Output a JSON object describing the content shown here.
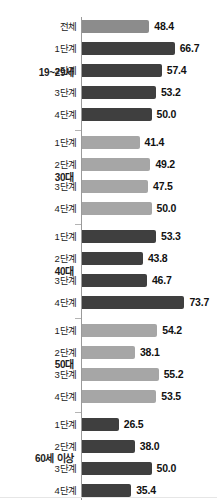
{
  "chart_data": {
    "type": "bar",
    "orientation": "horizontal",
    "title": "",
    "subtitle": "",
    "xlabel": "",
    "ylabel": "",
    "xlim": [
      0,
      80
    ],
    "grid": false,
    "legend": "none",
    "value_format": "one-decimal",
    "axis_color": "#9a9a9a",
    "colors": {
      "total_bar": "#8c8c8c",
      "dark_bar": "#3f3f3f",
      "light_bar": "#a6a6a6",
      "text": "#1c1c1c",
      "background": "#ffffff"
    },
    "groups": [
      {
        "label": "19~29세",
        "shade": "dark",
        "rows": [
          {
            "category": "전체",
            "value": 48.4,
            "shade": "total"
          },
          {
            "category": "1단계",
            "value": 66.7,
            "shade": "dark"
          },
          {
            "category": "2단계",
            "value": 57.4,
            "shade": "dark"
          },
          {
            "category": "3단계",
            "value": 53.2,
            "shade": "dark"
          },
          {
            "category": "4단계",
            "value": 50.0,
            "shade": "dark"
          }
        ]
      },
      {
        "label": "30대",
        "shade": "light",
        "rows": [
          {
            "category": "1단계",
            "value": 41.4,
            "shade": "light"
          },
          {
            "category": "2단계",
            "value": 49.2,
            "shade": "light"
          },
          {
            "category": "3단계",
            "value": 47.5,
            "shade": "light"
          },
          {
            "category": "4단계",
            "value": 50.0,
            "shade": "light"
          }
        ]
      },
      {
        "label": "40대",
        "shade": "dark",
        "rows": [
          {
            "category": "1단계",
            "value": 53.3,
            "shade": "dark"
          },
          {
            "category": "2단계",
            "value": 43.8,
            "shade": "dark"
          },
          {
            "category": "3단계",
            "value": 46.7,
            "shade": "dark"
          },
          {
            "category": "4단계",
            "value": 73.7,
            "shade": "dark"
          }
        ]
      },
      {
        "label": "50대",
        "shade": "light",
        "rows": [
          {
            "category": "1단계",
            "value": 54.2,
            "shade": "light"
          },
          {
            "category": "2단계",
            "value": 38.1,
            "shade": "light"
          },
          {
            "category": "3단계",
            "value": 55.2,
            "shade": "light"
          },
          {
            "category": "4단계",
            "value": 53.5,
            "shade": "light"
          }
        ]
      },
      {
        "label": "60세 이상",
        "shade": "dark",
        "rows": [
          {
            "category": "1단계",
            "value": 26.5,
            "shade": "dark"
          },
          {
            "category": "2단계",
            "value": 38.0,
            "shade": "dark"
          },
          {
            "category": "3단계",
            "value": 50.0,
            "shade": "dark"
          },
          {
            "category": "4단계",
            "value": 35.4,
            "shade": "dark"
          }
        ]
      }
    ]
  }
}
